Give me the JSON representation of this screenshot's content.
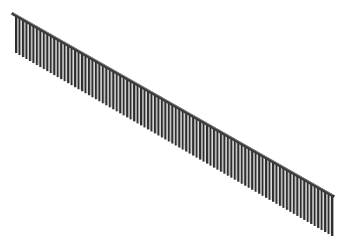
{
  "image": {
    "subject": "railing",
    "description": "3D render of a straight sloped railing with a top handrail and evenly spaced vertical balusters, viewed isometrically on a white background"
  },
  "railing": {
    "rail_start": [
      13,
      14
    ],
    "rail_end": [
      333,
      196
    ],
    "baluster_count": 92,
    "baluster_height": 40,
    "baluster_width": 2,
    "rail_thickness": 3
  },
  "colors": {
    "background": "#ffffff",
    "rail": "#3a3a3a",
    "rail_highlight": "#8a8a8a",
    "baluster": "#2e2e2e",
    "baluster_highlight": "#9a9a9a"
  }
}
